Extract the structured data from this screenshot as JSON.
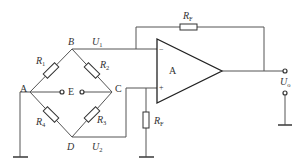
{
  "diagram": {
    "type": "bridge amplifier circuit",
    "nodes": {
      "A": "A",
      "B": "B",
      "C": "C",
      "D": "D",
      "E": "E"
    },
    "resistors": {
      "r1": {
        "main": "R",
        "sub": "1"
      },
      "r2": {
        "main": "R",
        "sub": "2"
      },
      "r3": {
        "main": "R",
        "sub": "3"
      },
      "r4": {
        "main": "R",
        "sub": "4"
      },
      "rf_feedback": {
        "main": "R",
        "sub": "F"
      },
      "rf_ground": {
        "main": "R",
        "sub": "F"
      }
    },
    "voltages": {
      "u1": {
        "main": "U",
        "sub": "1"
      },
      "u2": {
        "main": "U",
        "sub": "2"
      },
      "uo": {
        "main": "U",
        "sub": "o"
      }
    },
    "opamp": {
      "label": "A",
      "inverting": "−",
      "noninverting": "+"
    }
  }
}
